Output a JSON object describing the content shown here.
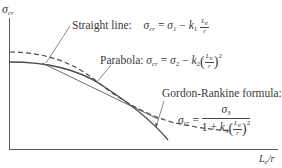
{
  "diagram": {
    "type": "column buckling design curves",
    "y_axis_label": "σcr",
    "x_axis_label": "Le/r",
    "curves": [
      {
        "name": "straight-line",
        "style": "solid-thin",
        "label": "Straight line:",
        "formula": "σcr = σ1 − k1 Le/r"
      },
      {
        "name": "parabola",
        "style": "solid",
        "label": "Parabola:",
        "formula": "σcr = σ2 − k2 (Le/r)^2"
      },
      {
        "name": "gordon-rankine",
        "style": "dashed",
        "label": "Gordon-Rankine formula:",
        "formula": "σcr = σ3 / (1 + k3 (Le/r)^2)"
      }
    ]
  },
  "labels": {
    "ylabel_sigma": "σ",
    "ylabel_sub": "cr",
    "xlabel_L": "L",
    "xlabel_sub": "e",
    "xlabel_rest": "/r",
    "straight_title": "Straight line:",
    "parabola_title": "Parabola:",
    "gordon_title": "Gordon-Rankine formula:",
    "sigma": "σ",
    "cr": "cr",
    "eq": "=",
    "minus": "−",
    "one": "1",
    "two": "2",
    "three": "3",
    "k": "k",
    "plus": "1 +",
    "Le_L": "L",
    "Le_e": "e",
    "r": "r",
    "lparen": "(",
    "rparen": ")",
    "sq": "2"
  },
  "colors": {
    "axis": "#555555",
    "curve": "#4a4a4a",
    "text": "#3a3a3a"
  }
}
